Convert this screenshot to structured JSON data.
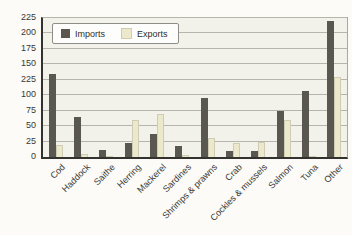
{
  "chart_data": {
    "type": "bar",
    "title": "",
    "xlabel": "",
    "ylabel": "",
    "categories": [
      "Cod",
      "Haddock",
      "Saithe",
      "Herring",
      "Mackerel",
      "Sardines",
      "Shrimps & prawns",
      "Crab",
      "Cockles & mussels",
      "Salmon",
      "Tuna",
      "Other"
    ],
    "series": [
      {
        "name": "Imports",
        "color": "#5a5751",
        "values": [
          135,
          65,
          12,
          22,
          38,
          18,
          95,
          10,
          10,
          75,
          107,
          220
        ]
      },
      {
        "name": "Exports",
        "color": "#ebe8cc",
        "values": [
          20,
          5,
          2,
          60,
          70,
          3,
          30,
          22,
          25,
          60,
          2,
          130
        ]
      }
    ],
    "ylim": [
      0,
      225
    ],
    "y_tick_values": [
      0,
      25,
      50,
      75,
      100,
      125,
      150,
      175,
      200,
      225
    ],
    "y_tick_labels": [
      "0",
      "25",
      "50",
      "75",
      "100",
      "225",
      "150",
      "175",
      "200",
      "225"
    ],
    "grid": true,
    "legend_position": "top-left"
  },
  "colors": {
    "plot_background": "#f2f1ea",
    "gridline": "#b6b4ad",
    "axis": "#34322e",
    "imports": "#5a5751",
    "exports": "#ebe8cc"
  }
}
